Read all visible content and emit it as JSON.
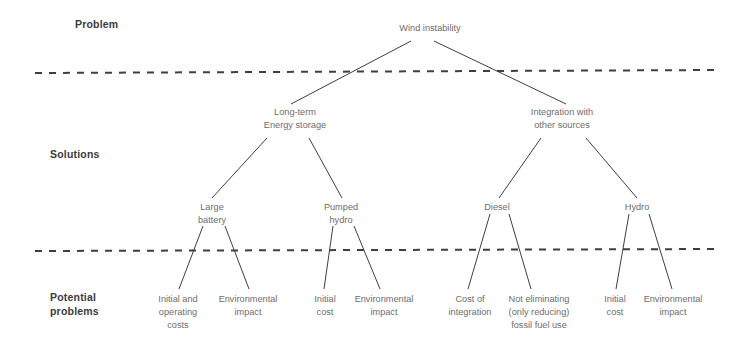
{
  "diagram": {
    "style": {
      "background": "#ffffff",
      "node_text_color": "#6d6d6d",
      "tier_label_color": "#3b3b3b",
      "edge_color": "#3f3f3f",
      "divider_color": "#3f3f3f"
    },
    "tier_labels": [
      {
        "id": "tier-problem",
        "text": "Problem",
        "x": 75,
        "y": 17
      },
      {
        "id": "tier-solutions",
        "text": "Solutions",
        "x": 50,
        "y": 147
      },
      {
        "id": "tier-potential-problems",
        "text": "Potential\nproblems",
        "x": 50,
        "y": 290
      }
    ],
    "dividers": [
      {
        "id": "divider-top",
        "x1": 35,
        "y1": 73,
        "x2": 716,
        "y2": 70
      },
      {
        "id": "divider-bottom",
        "x1": 35,
        "y1": 251,
        "x2": 716,
        "y2": 249
      }
    ],
    "nodes": [
      {
        "id": "wind-instability",
        "text": "Wind instability",
        "x": 430,
        "y": 22
      },
      {
        "id": "long-term-energy-storage",
        "text": "Long-term\nEnergy storage",
        "x": 295,
        "y": 106
      },
      {
        "id": "integration-other-sources",
        "text": "Integration with\nother sources",
        "x": 562,
        "y": 106
      },
      {
        "id": "large-battery",
        "text": "Large\nbattery",
        "x": 212,
        "y": 201
      },
      {
        "id": "pumped-hydro",
        "text": "Pumped\nhydro",
        "x": 341,
        "y": 201
      },
      {
        "id": "diesel",
        "text": "Diesel",
        "x": 497,
        "y": 201
      },
      {
        "id": "hydro",
        "text": "Hydro",
        "x": 637,
        "y": 201
      },
      {
        "id": "initial-operating-costs",
        "text": "Initial and\noperating\ncosts",
        "x": 178,
        "y": 293
      },
      {
        "id": "environmental-impact-battery",
        "text": "Environmental\nimpact",
        "x": 248,
        "y": 293
      },
      {
        "id": "initial-cost-pumped",
        "text": "Initial\ncost",
        "x": 325,
        "y": 293
      },
      {
        "id": "environmental-impact-pumped",
        "text": "Environmental\nimpact",
        "x": 384,
        "y": 293
      },
      {
        "id": "cost-of-integration",
        "text": "Cost of\nintegration",
        "x": 470,
        "y": 293
      },
      {
        "id": "not-eliminating-fossil",
        "text": "Not eliminating\n(only reducing)\nfossil fuel use",
        "x": 539,
        "y": 293
      },
      {
        "id": "initial-cost-hydro",
        "text": "Initial\ncost",
        "x": 615,
        "y": 293
      },
      {
        "id": "environmental-impact-hydro",
        "text": "Environmental\nimpact",
        "x": 673,
        "y": 293
      }
    ],
    "edges": [
      {
        "id": "edge-root-to-storage",
        "from": "wind-instability",
        "to": "long-term-energy-storage",
        "x1": 411,
        "y1": 41,
        "x2": 291,
        "y2": 104
      },
      {
        "id": "edge-root-to-integration",
        "from": "wind-instability",
        "to": "integration-other-sources",
        "x1": 434,
        "y1": 41,
        "x2": 566,
        "y2": 104
      },
      {
        "id": "edge-storage-to-battery",
        "from": "long-term-energy-storage",
        "to": "large-battery",
        "x1": 267,
        "y1": 138,
        "x2": 212,
        "y2": 198
      },
      {
        "id": "edge-storage-to-pumped",
        "from": "long-term-energy-storage",
        "to": "pumped-hydro",
        "x1": 309,
        "y1": 138,
        "x2": 342,
        "y2": 198
      },
      {
        "id": "edge-integration-to-diesel",
        "from": "integration-other-sources",
        "to": "diesel",
        "x1": 541,
        "y1": 138,
        "x2": 499,
        "y2": 198
      },
      {
        "id": "edge-integration-to-hydro",
        "from": "integration-other-sources",
        "to": "hydro",
        "x1": 586,
        "y1": 138,
        "x2": 637,
        "y2": 198
      },
      {
        "id": "edge-battery-to-initial-operating",
        "from": "large-battery",
        "to": "initial-operating-costs",
        "x1": 203,
        "y1": 226,
        "x2": 179,
        "y2": 289
      },
      {
        "id": "edge-battery-to-environmental",
        "from": "large-battery",
        "to": "environmental-impact-battery",
        "x1": 225,
        "y1": 226,
        "x2": 249,
        "y2": 289
      },
      {
        "id": "edge-pumped-to-initial-cost",
        "from": "pumped-hydro",
        "to": "initial-cost-pumped",
        "x1": 333,
        "y1": 226,
        "x2": 324,
        "y2": 289
      },
      {
        "id": "edge-pumped-to-environmental",
        "from": "pumped-hydro",
        "to": "environmental-impact-pumped",
        "x1": 354,
        "y1": 226,
        "x2": 380,
        "y2": 289
      },
      {
        "id": "edge-diesel-to-cost-integration",
        "from": "diesel",
        "to": "cost-of-integration",
        "x1": 490,
        "y1": 214,
        "x2": 468,
        "y2": 289
      },
      {
        "id": "edge-diesel-to-not-eliminating",
        "from": "diesel",
        "to": "not-eliminating-fossil",
        "x1": 509,
        "y1": 214,
        "x2": 531,
        "y2": 289
      },
      {
        "id": "edge-hydro-to-initial-cost",
        "from": "hydro",
        "to": "initial-cost-hydro",
        "x1": 629,
        "y1": 214,
        "x2": 616,
        "y2": 289
      },
      {
        "id": "edge-hydro-to-environmental",
        "from": "hydro",
        "to": "environmental-impact-hydro",
        "x1": 649,
        "y1": 214,
        "x2": 672,
        "y2": 289
      }
    ]
  }
}
